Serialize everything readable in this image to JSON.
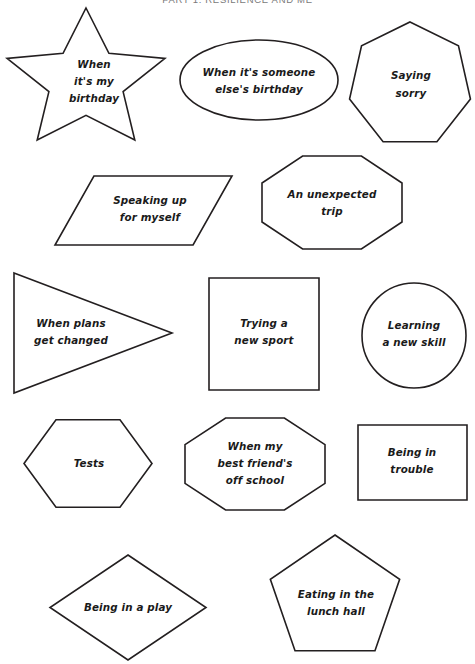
{
  "header": {
    "title": "PART 1: RESILIENCE AND ME"
  },
  "page": {
    "width": 475,
    "height": 664,
    "background": "#ffffff",
    "stroke_color": "#231f20",
    "text_color": "#1a1a1a",
    "header_color": "#7a7a7a"
  },
  "shapes": [
    {
      "id": "when-its-my-birthday",
      "shape": "star",
      "label": "When\nit's my\nbirthday",
      "lines": [
        "When",
        "it's my",
        "birthday"
      ],
      "box": {
        "x": 3,
        "y": 8,
        "w": 166,
        "h": 146
      },
      "text": {
        "cx": 94,
        "cy": 68,
        "line_height": 17,
        "font_size": 10.5
      }
    },
    {
      "id": "when-its-someone-elses-birthday",
      "shape": "ellipse",
      "label": "When it's someone\nelse's birthday",
      "lines": [
        "When it's someone",
        "else's birthday"
      ],
      "box": {
        "x": 180,
        "y": 40,
        "w": 158,
        "h": 80
      },
      "text": {
        "cx": 259,
        "cy": 76,
        "line_height": 17,
        "font_size": 10.5
      }
    },
    {
      "id": "saying-sorry",
      "shape": "heptagon",
      "label": "Saying\nsorry",
      "lines": [
        "Saying",
        "sorry"
      ],
      "box": {
        "x": 348,
        "y": 22,
        "w": 124,
        "h": 126
      },
      "text": {
        "cx": 411,
        "cy": 79,
        "line_height": 18,
        "font_size": 10.5
      }
    },
    {
      "id": "speaking-up-for-myself",
      "shape": "parallelogram",
      "label": "Speaking up\nfor myself",
      "lines": [
        "Speaking up",
        "for myself"
      ],
      "box": {
        "x": 55,
        "y": 176,
        "w": 177,
        "h": 69
      },
      "text": {
        "cx": 150,
        "cy": 204,
        "line_height": 17,
        "font_size": 10.5
      }
    },
    {
      "id": "an-unexpected-trip",
      "shape": "octagon",
      "label": "An unexpected\ntrip",
      "lines": [
        "An unexpected",
        "trip"
      ],
      "box": {
        "x": 262,
        "y": 156,
        "w": 140,
        "h": 93
      },
      "text": {
        "cx": 332,
        "cy": 198,
        "line_height": 17,
        "font_size": 10.5
      }
    },
    {
      "id": "when-plans-get-changed",
      "shape": "triangle-right",
      "label": "When plans\nget changed",
      "lines": [
        "When plans",
        "get changed"
      ],
      "box": {
        "x": 14,
        "y": 273,
        "w": 158,
        "h": 120
      },
      "text": {
        "cx": 71,
        "cy": 327,
        "line_height": 17,
        "font_size": 10.5
      }
    },
    {
      "id": "trying-a-new-sport",
      "shape": "square",
      "label": "Trying a\nnew sport",
      "lines": [
        "Trying a",
        "new sport"
      ],
      "box": {
        "x": 209,
        "y": 278,
        "w": 110,
        "h": 112
      },
      "text": {
        "cx": 264,
        "cy": 327,
        "line_height": 17,
        "font_size": 10.5
      }
    },
    {
      "id": "learning-a-new-skill",
      "shape": "circle",
      "label": "Learning\na new skill",
      "lines": [
        "Learning",
        "a new skill"
      ],
      "box": {
        "x": 362,
        "y": 283,
        "w": 104,
        "h": 105
      },
      "text": {
        "cx": 414,
        "cy": 329,
        "line_height": 17,
        "font_size": 10.5
      }
    },
    {
      "id": "tests",
      "shape": "hexagon",
      "label": "Tests",
      "lines": [
        "Tests"
      ],
      "box": {
        "x": 24,
        "y": 413,
        "w": 128,
        "h": 101
      },
      "text": {
        "cx": 89,
        "cy": 467,
        "line_height": 17,
        "font_size": 10.5
      }
    },
    {
      "id": "when-my-best-friends-off-school",
      "shape": "octagon",
      "label": "When my\nbest friend's\noff school",
      "lines": [
        "When my",
        "best friend's",
        "off school"
      ],
      "box": {
        "x": 185,
        "y": 418,
        "w": 140,
        "h": 92
      },
      "text": {
        "cx": 255,
        "cy": 450,
        "line_height": 17,
        "font_size": 10.5
      }
    },
    {
      "id": "being-in-trouble",
      "shape": "rectangle",
      "label": "Being in\ntrouble",
      "lines": [
        "Being in",
        "trouble"
      ],
      "box": {
        "x": 358,
        "y": 425,
        "w": 109,
        "h": 75
      },
      "text": {
        "cx": 412,
        "cy": 456,
        "line_height": 17,
        "font_size": 10.5
      }
    },
    {
      "id": "being-in-a-play",
      "shape": "diamond",
      "label": "Being in a play",
      "lines": [
        "Being in a play"
      ],
      "box": {
        "x": 50,
        "y": 555,
        "w": 156,
        "h": 105
      },
      "text": {
        "cx": 128,
        "cy": 611,
        "line_height": 17,
        "font_size": 10.5
      }
    },
    {
      "id": "eating-in-the-lunch-hall",
      "shape": "pentagon",
      "label": "Eating in the\nlunch hall",
      "lines": [
        "Eating in the",
        "lunch hall"
      ],
      "box": {
        "x": 267,
        "y": 535,
        "w": 136,
        "h": 128
      },
      "text": {
        "cx": 336,
        "cy": 598,
        "line_height": 17,
        "font_size": 10.5
      }
    }
  ]
}
